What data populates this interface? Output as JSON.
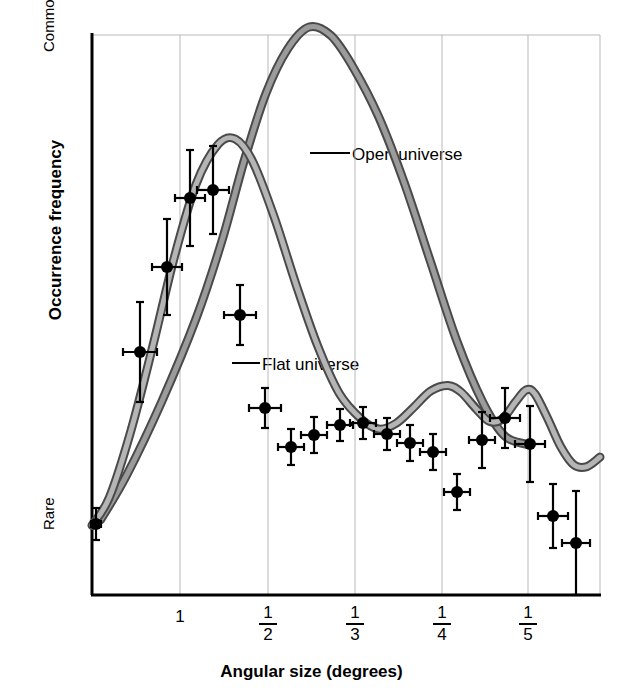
{
  "chart_data": {
    "type": "line",
    "title": "",
    "xlabel": "Angular size (degrees)",
    "ylabel": "Occurrence frequency",
    "grid": true,
    "legend_position": "inline-annotations",
    "x_tick_labels": [
      "1",
      "1/2",
      "1/3",
      "1/4",
      "1/5"
    ],
    "x_tick_positions_px": [
      180,
      268,
      355,
      442,
      528
    ],
    "y_tick_labels": [
      "Common",
      "Rare"
    ],
    "y_axis_note": "qualitative axis: Rare at bottom, Common at top",
    "xlim_note": "inverse angular size, from just above 1 degree down to about 1/6 degree",
    "series": [
      {
        "name": "Open universe",
        "style": "band",
        "color_outline": "#4a4a4a",
        "color_fill": "#9b9b9b",
        "annotation": "Open universe",
        "points": [
          {
            "x": 0.02,
            "y": 0.12
          },
          {
            "x": 0.08,
            "y": 0.2
          },
          {
            "x": 0.16,
            "y": 0.33
          },
          {
            "x": 0.24,
            "y": 0.48
          },
          {
            "x": 0.3,
            "y": 0.62
          },
          {
            "x": 0.35,
            "y": 0.76
          },
          {
            "x": 0.4,
            "y": 0.88
          },
          {
            "x": 0.45,
            "y": 0.96
          },
          {
            "x": 0.5,
            "y": 1.0
          },
          {
            "x": 0.55,
            "y": 0.985
          },
          {
            "x": 0.6,
            "y": 0.93
          },
          {
            "x": 0.66,
            "y": 0.84
          },
          {
            "x": 0.72,
            "y": 0.72
          },
          {
            "x": 0.78,
            "y": 0.58
          },
          {
            "x": 0.84,
            "y": 0.44
          },
          {
            "x": 0.9,
            "y": 0.33
          },
          {
            "x": 0.95,
            "y": 0.27
          },
          {
            "x": 1.0,
            "y": 0.255
          }
        ]
      },
      {
        "name": "Flat universe",
        "style": "band",
        "color_outline": "#4a4a4a",
        "color_fill": "#b5b5b5",
        "annotation": "Flat universe",
        "points": [
          {
            "x": 0.0,
            "y": 0.11
          },
          {
            "x": 0.04,
            "y": 0.16
          },
          {
            "x": 0.09,
            "y": 0.28
          },
          {
            "x": 0.14,
            "y": 0.43
          },
          {
            "x": 0.19,
            "y": 0.59
          },
          {
            "x": 0.24,
            "y": 0.72
          },
          {
            "x": 0.29,
            "y": 0.79
          },
          {
            "x": 0.33,
            "y": 0.8
          },
          {
            "x": 0.37,
            "y": 0.76
          },
          {
            "x": 0.42,
            "y": 0.66
          },
          {
            "x": 0.47,
            "y": 0.54
          },
          {
            "x": 0.52,
            "y": 0.43
          },
          {
            "x": 0.57,
            "y": 0.345
          },
          {
            "x": 0.62,
            "y": 0.3
          },
          {
            "x": 0.66,
            "y": 0.282
          },
          {
            "x": 0.7,
            "y": 0.292
          },
          {
            "x": 0.74,
            "y": 0.32
          },
          {
            "x": 0.78,
            "y": 0.35
          },
          {
            "x": 0.82,
            "y": 0.36
          },
          {
            "x": 0.85,
            "y": 0.348
          },
          {
            "x": 0.885,
            "y": 0.318
          },
          {
            "x": 0.915,
            "y": 0.296
          },
          {
            "x": 0.945,
            "y": 0.3
          },
          {
            "x": 0.975,
            "y": 0.33
          },
          {
            "x": 1.0,
            "y": 0.352
          },
          {
            "x": 1.02,
            "y": 0.345
          },
          {
            "x": 1.05,
            "y": 0.3
          },
          {
            "x": 1.08,
            "y": 0.25
          },
          {
            "x": 1.11,
            "y": 0.218
          },
          {
            "x": 1.14,
            "y": 0.215
          },
          {
            "x": 1.17,
            "y": 0.232
          }
        ]
      }
    ],
    "data_points": [
      {
        "x_px": 96,
        "y_px": 524,
        "err_y_px": 16,
        "err_x_px": 5
      },
      {
        "x_px": 140,
        "y_px": 352,
        "err_y_px": 50,
        "err_x_px": 17
      },
      {
        "x_px": 167,
        "y_px": 267,
        "err_y_px": 48,
        "err_x_px": 15
      },
      {
        "x_px": 190,
        "y_px": 198,
        "err_y_px": 48,
        "err_x_px": 15
      },
      {
        "x_px": 213,
        "y_px": 190,
        "err_y_px": 44,
        "err_x_px": 16
      },
      {
        "x_px": 240,
        "y_px": 315,
        "err_y_px": 30,
        "err_x_px": 16
      },
      {
        "x_px": 265,
        "y_px": 408,
        "err_y_px": 20,
        "err_x_px": 16
      },
      {
        "x_px": 291,
        "y_px": 447,
        "err_y_px": 18,
        "err_x_px": 13
      },
      {
        "x_px": 314,
        "y_px": 435,
        "err_y_px": 18,
        "err_x_px": 13
      },
      {
        "x_px": 340,
        "y_px": 425,
        "err_y_px": 16,
        "err_x_px": 13
      },
      {
        "x_px": 363,
        "y_px": 423,
        "err_y_px": 16,
        "err_x_px": 13
      },
      {
        "x_px": 387,
        "y_px": 434,
        "err_y_px": 16,
        "err_x_px": 13
      },
      {
        "x_px": 410,
        "y_px": 443,
        "err_y_px": 18,
        "err_x_px": 13
      },
      {
        "x_px": 433,
        "y_px": 452,
        "err_y_px": 18,
        "err_x_px": 13
      },
      {
        "x_px": 457,
        "y_px": 492,
        "err_y_px": 18,
        "err_x_px": 13
      },
      {
        "x_px": 482,
        "y_px": 440,
        "err_y_px": 28,
        "err_x_px": 13
      },
      {
        "x_px": 505,
        "y_px": 418,
        "err_y_px": 30,
        "err_x_px": 15
      },
      {
        "x_px": 530,
        "y_px": 444,
        "err_y_px": 38,
        "err_x_px": 15
      },
      {
        "x_px": 553,
        "y_px": 516,
        "err_y_px": 32,
        "err_x_px": 15
      },
      {
        "x_px": 576,
        "y_px": 543,
        "err_y_px": 52,
        "err_x_px": 14
      }
    ],
    "marker": {
      "shape": "circle",
      "color": "#000000",
      "radius_px": 6
    },
    "errorbar_color": "#000000"
  },
  "axes": {
    "y_top_label": "Common",
    "y_bottom_label": "Rare",
    "y_axis_title": "Occurrence frequency",
    "x_axis_title": "Angular size (degrees)"
  },
  "ticks": {
    "t1": "1",
    "t2_num": "1",
    "t2_den": "2",
    "t3_num": "1",
    "t3_den": "3",
    "t4_num": "1",
    "t4_den": "4",
    "t5_num": "1",
    "t5_den": "5"
  },
  "annotations": {
    "open_universe": "Open universe",
    "flat_universe": "Flat universe"
  },
  "colors": {
    "band_outline": "#4a4a4a",
    "band_fill": "#a8a8a8",
    "gridline": "#b9b9b9",
    "axis": "#000000",
    "marker": "#000000",
    "background": "#ffffff"
  }
}
